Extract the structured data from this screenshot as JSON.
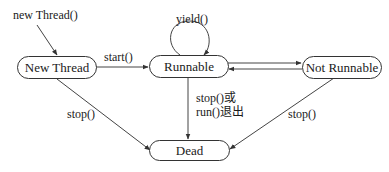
{
  "diagram": {
    "type": "state-diagram",
    "title": "",
    "nodes": [
      {
        "id": "new_thread",
        "label": "New Thread"
      },
      {
        "id": "runnable",
        "label": "Runnable"
      },
      {
        "id": "not_runnable",
        "label": "Not Runnable"
      },
      {
        "id": "dead",
        "label": "Dead"
      }
    ],
    "edges": [
      {
        "from": "(start)",
        "to": "new_thread",
        "label": "new Thread()"
      },
      {
        "from": "new_thread",
        "to": "runnable",
        "label": "start()"
      },
      {
        "from": "runnable",
        "to": "runnable",
        "label": "yield()"
      },
      {
        "from": "runnable",
        "to": "not_runnable",
        "label": ""
      },
      {
        "from": "not_runnable",
        "to": "runnable",
        "label": ""
      },
      {
        "from": "new_thread",
        "to": "dead",
        "label": "stop()"
      },
      {
        "from": "runnable",
        "to": "dead",
        "label_line1": "stop()或",
        "label_line2": "run()退出"
      },
      {
        "from": "not_runnable",
        "to": "dead",
        "label": "stop()"
      }
    ],
    "colors": {
      "line": "#333333",
      "background": "#ffffff",
      "text": "#1a1a1a"
    }
  }
}
